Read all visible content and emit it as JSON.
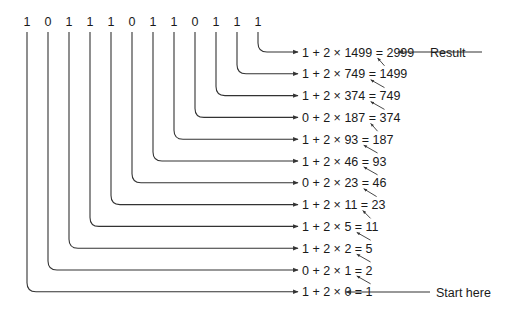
{
  "diagram": {
    "title": "",
    "bits": [
      "1",
      "0",
      "1",
      "1",
      "1",
      "0",
      "1",
      "1",
      "0",
      "1",
      "1",
      "1"
    ],
    "rows": [
      {
        "expr": "1 + 2 × 1499 = 2999",
        "bit": "1",
        "prev": "1499",
        "value": "2999"
      },
      {
        "expr": "1 + 2 × 749 = 1499",
        "bit": "1",
        "prev": "749",
        "value": "1499"
      },
      {
        "expr": "1 + 2 × 374 = 749",
        "bit": "1",
        "prev": "374",
        "value": "749"
      },
      {
        "expr": "0 + 2 × 187 = 374",
        "bit": "0",
        "prev": "187",
        "value": "374"
      },
      {
        "expr": "1 + 2 × 93 = 187",
        "bit": "1",
        "prev": "93",
        "value": "187"
      },
      {
        "expr": "1 + 2 × 46 = 93",
        "bit": "1",
        "prev": "46",
        "value": "93"
      },
      {
        "expr": "0 + 2 × 23 = 46",
        "bit": "0",
        "prev": "23",
        "value": "46"
      },
      {
        "expr": "1 + 2 × 11 = 23",
        "bit": "1",
        "prev": "11",
        "value": "23"
      },
      {
        "expr": "1 + 2 × 5 = 11",
        "bit": "1",
        "prev": "5",
        "value": "11"
      },
      {
        "expr": "1 + 2 × 2 = 5",
        "bit": "1",
        "prev": "2",
        "value": "5"
      },
      {
        "expr": "0 + 2 × 1 = 2",
        "bit": "0",
        "prev": "1",
        "value": "2"
      },
      {
        "expr": "1 + 2 × 0 = 1",
        "bit": "1",
        "prev": "0",
        "value": "1"
      }
    ],
    "labels": {
      "result": "Result",
      "start": "Start here"
    },
    "colors": {
      "line": "#333333",
      "text": "#1a1a1a",
      "background": "#ffffff"
    }
  }
}
